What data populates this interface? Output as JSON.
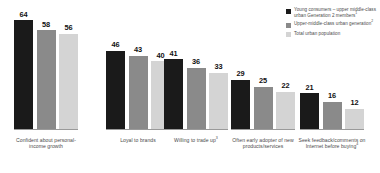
{
  "chart_data": {
    "type": "bar",
    "title": "",
    "subtitle": "",
    "xlabel": "",
    "ylabel": "",
    "ylim": [
      0,
      70
    ],
    "grid": false,
    "legend_position": "top-right",
    "orientation": "vertical",
    "grouping": "clustered",
    "value_suffix": "",
    "categories": [
      "Confident about personal-income growth",
      "Loyal to brands",
      "Willing to trade up",
      "Often early adopter of new products/services",
      "Seek feedback/comments on Internet before buying"
    ],
    "category_superscripts": [
      "",
      "",
      "3",
      "",
      "4"
    ],
    "series": [
      {
        "name": "Young consumers – upper-middle-class urban Generation 2 members",
        "name_superscript": "1",
        "color": "#1a1a1a",
        "values": [
          64,
          58,
          41,
          29,
          21
        ]
      },
      {
        "name": "Upper-middle-class urban generation",
        "name_superscript": "2",
        "color": "#8a8a8a",
        "values": [
          58,
          43,
          36,
          25,
          16
        ]
      },
      {
        "name": "Total urban population",
        "name_superscript": "",
        "color": "#d4d4d4",
        "values": [
          56,
          40,
          33,
          22,
          12
        ]
      }
    ]
  },
  "legend": {
    "items": [
      {
        "label": "Young consumers – upper middle-class urban Generation 2 members",
        "superscript": "1",
        "color": "#1a1a1a"
      },
      {
        "label": "Upper-middle-class urban generation",
        "superscript": "2",
        "color": "#8a8a8a"
      },
      {
        "label": "Total urban population",
        "superscript": "",
        "color": "#d4d4d4"
      }
    ]
  },
  "groups": [
    {
      "label": "Confident about personal-income growth",
      "superscript": "",
      "values": [
        64,
        58,
        56
      ]
    },
    {
      "label": "Loyal to brands",
      "superscript": "",
      "values": [
        46,
        43,
        40
      ]
    },
    {
      "label": "Willing to trade up",
      "superscript": "3",
      "values": [
        41,
        36,
        33
      ]
    },
    {
      "label": "Often early adopter of new products/services",
      "superscript": "",
      "values": [
        29,
        25,
        22
      ]
    },
    {
      "label": "Seek feedback/comments on Internet before buying",
      "superscript": "4",
      "values": [
        21,
        16,
        12
      ]
    }
  ]
}
